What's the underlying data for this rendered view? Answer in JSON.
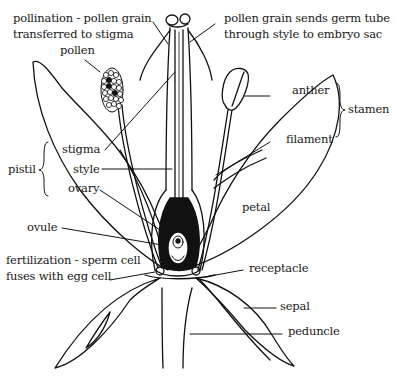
{
  "diagram": {
    "type": "flower-anatomy",
    "labels": {
      "pollination_line1": "pollination - pollen grain",
      "pollination_line2": "transferred to stigma",
      "germ_tube_line1": "pollen grain sends germ tube",
      "germ_tube_line2": "through style to embryo sac",
      "pollen": "pollen",
      "anther": "anther",
      "stamen": "stamen",
      "stigma": "stigma",
      "pistil": "pistil",
      "style": "style",
      "filament": "filament",
      "ovary": "ovary",
      "petal": "petal",
      "ovule": "ovule",
      "fertilization_line1": "fertilization - sperm cell",
      "fertilization_line2": "fuses with egg cell",
      "receptacle": "receptacle",
      "sepal": "sepal",
      "peduncle": "peduncle"
    },
    "groups": {
      "pistil": [
        "stigma",
        "style",
        "ovary"
      ],
      "stamen": [
        "anther",
        "filament"
      ]
    }
  }
}
